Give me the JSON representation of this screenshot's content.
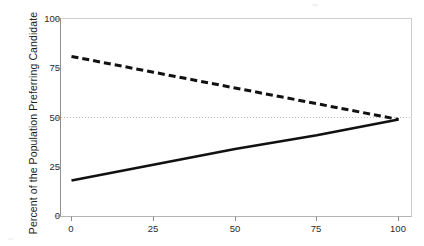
{
  "chart_data": {
    "type": "line",
    "title": "",
    "xlabel": "Percentage of the Population Spreading Rumor",
    "ylabel": "Percent of the Population Preferring Candidate",
    "xlim": [
      0,
      100
    ],
    "ylim": [
      0,
      100
    ],
    "xticks": [
      0,
      25,
      50,
      75,
      100
    ],
    "yticks": [
      0,
      25,
      50,
      75,
      100
    ],
    "xticklabels": [
      "0",
      "25",
      "50",
      "75",
      "100"
    ],
    "yticklabels": [
      "0",
      "25",
      "50",
      "75",
      "100"
    ],
    "grid": false,
    "legend": "none",
    "annotations": [
      "Horizontal dotted reference line at y = 50",
      "X axis title is cropped off at the bottom edge of the image"
    ],
    "reference_lines": [
      {
        "name": "fifty-percent-line",
        "orientation": "horizontal",
        "value": 50,
        "style": "dotted",
        "color": "#bcbcbc"
      }
    ],
    "series": [
      {
        "name": "Candidate B (dashed)",
        "style": "dashed",
        "color": "#111111",
        "x": [
          0,
          25,
          50,
          75,
          100
        ],
        "values": [
          81,
          73,
          65,
          57,
          49
        ]
      },
      {
        "name": "Candidate A (solid)",
        "style": "solid",
        "color": "#111111",
        "x": [
          0,
          25,
          50,
          75,
          100
        ],
        "values": [
          18,
          26,
          34,
          41,
          49
        ]
      }
    ]
  },
  "axes": {
    "y_title": "Percent of the Population Preferring Candidate",
    "x_title_visible_fragment": "",
    "y_labels": [
      "100",
      "75",
      "50",
      "25",
      "0"
    ],
    "x_labels": [
      "0",
      "25",
      "50",
      "75",
      "100"
    ]
  },
  "colors": {
    "panel_border": "#cfcfcf",
    "axis_line": "#8f8f8f",
    "series_line": "#111111",
    "reference_line": "#bcbcbc",
    "background": "#ffffff",
    "text": "#1d1d1d"
  }
}
